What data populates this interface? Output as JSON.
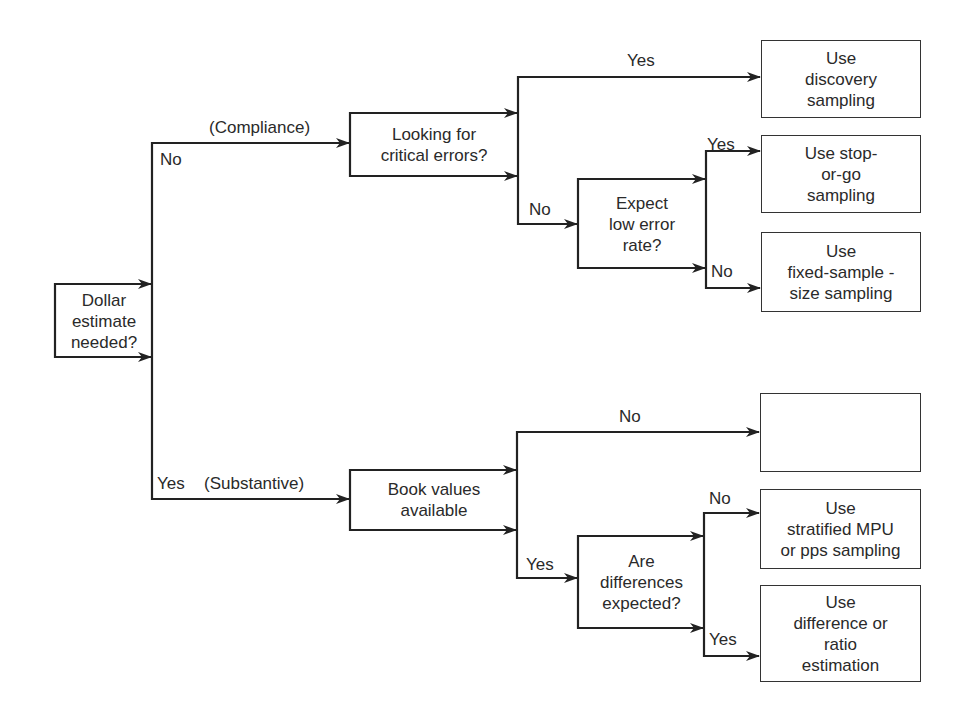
{
  "diagram": {
    "type": "decision-tree",
    "root": {
      "text": "Dollar\nestimate\nneeded?"
    },
    "branches": {
      "no_label": "No",
      "no_category": "(Compliance)",
      "yes_label": "Yes",
      "yes_category": "(Substantive)"
    },
    "compliance": {
      "question": "Looking for\ncritical errors?",
      "yes_label": "Yes",
      "no_label": "No",
      "yes_outcome": "Use\ndiscovery\nsampling",
      "sub_question": "Expect\nlow error\nrate?",
      "sub_yes_label": "Yes",
      "sub_no_label": "No",
      "sub_yes_outcome": "Use stop-\nor-go\nsampling",
      "sub_no_outcome": "Use\nfixed-sample -\nsize sampling"
    },
    "substantive": {
      "question": "Book values\navailable",
      "no_label": "No",
      "yes_label": "Yes",
      "no_outcome": "",
      "sub_question": "Are\ndifferences\nexpected?",
      "sub_no_label": "No",
      "sub_yes_label": "Yes",
      "sub_no_outcome": "Use\nstratified MPU\nor pps sampling",
      "sub_yes_outcome": "Use\ndifference or\nratio\nestimation"
    }
  },
  "colors": {
    "line": "#222222",
    "text": "#2a2a2a",
    "background": "#ffffff"
  }
}
